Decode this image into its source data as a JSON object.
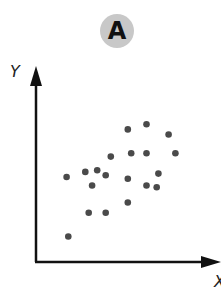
{
  "panel": {
    "label": "A",
    "badge_color": "#c8c8c8"
  },
  "chart_data": {
    "type": "scatter",
    "title": "A",
    "xlabel": "X",
    "ylabel": "Y",
    "ticks": false,
    "grid": false,
    "legend": null,
    "marker_color": "#4a4a4a",
    "note": "Unlabeled axes; points given as approximate pixel-relative coordinates (x from y-axis, y up from x-axis, 0-100 scale)",
    "xlim": [
      0,
      100
    ],
    "ylim": [
      0,
      100
    ],
    "points": [
      {
        "x": 19,
        "y": 15
      },
      {
        "x": 18,
        "y": 50
      },
      {
        "x": 29,
        "y": 53
      },
      {
        "x": 36,
        "y": 54
      },
      {
        "x": 41,
        "y": 51
      },
      {
        "x": 33,
        "y": 45
      },
      {
        "x": 44,
        "y": 62
      },
      {
        "x": 31,
        "y": 29
      },
      {
        "x": 41,
        "y": 29
      },
      {
        "x": 54,
        "y": 78
      },
      {
        "x": 65,
        "y": 81
      },
      {
        "x": 78,
        "y": 75
      },
      {
        "x": 56,
        "y": 64
      },
      {
        "x": 65,
        "y": 64
      },
      {
        "x": 82,
        "y": 64
      },
      {
        "x": 54,
        "y": 49
      },
      {
        "x": 72,
        "y": 52
      },
      {
        "x": 65,
        "y": 45
      },
      {
        "x": 71,
        "y": 44
      },
      {
        "x": 54,
        "y": 35
      }
    ]
  }
}
